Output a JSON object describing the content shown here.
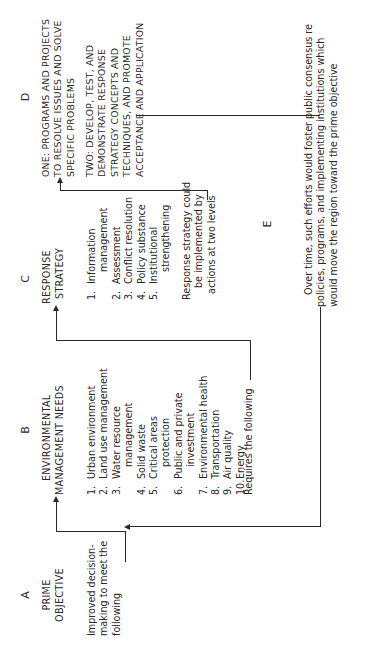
{
  "diagram": {
    "orientation": "rotated 90 degrees counter-clockwise",
    "columns": {
      "A": {
        "letter": "A",
        "heading": [
          "PRIME",
          "OBJECTIVE"
        ],
        "text": [
          "Improved decision-",
          "making to meet the",
          "following"
        ]
      },
      "B": {
        "letter": "B",
        "heading": [
          "ENVIRONMENTAL",
          "MANAGEMENT NEEDS"
        ],
        "items": [
          {
            "num": "1.",
            "label": "Urban environment"
          },
          {
            "num": "2.",
            "label": "Land use management"
          },
          {
            "num": "3.",
            "label": "Water resource",
            "cont": "management"
          },
          {
            "num": "4.",
            "label": "Solid waste"
          },
          {
            "num": "5.",
            "label": "Critical areas",
            "cont": "protection"
          },
          {
            "num": "6.",
            "label": "Public and private",
            "cont": "investment"
          },
          {
            "num": "7.",
            "label": "Environmental health"
          },
          {
            "num": "8.",
            "label": "Transportation"
          },
          {
            "num": "9.",
            "label": "Air quality"
          },
          {
            "num": "10.",
            "label": "Energy"
          }
        ],
        "footer": "Requires the following"
      },
      "C": {
        "letter": "C",
        "heading": [
          "RESPONSE",
          "STRATEGY"
        ],
        "items": [
          {
            "num": "1.",
            "label": "Information",
            "cont": "management"
          },
          {
            "num": "2.",
            "label": "Assessment"
          },
          {
            "num": "3.",
            "label": "Conflict resolution"
          },
          {
            "num": "4.",
            "label": "Policy substance"
          },
          {
            "num": "5.",
            "label": "Institutional",
            "cont": "strengthening"
          }
        ],
        "footer": [
          "Response strategy could",
          "be implemented by",
          "actions at two levels"
        ]
      },
      "D": {
        "letter": "D",
        "one": [
          "ONE: PROGRAMS AND PROJECTS",
          "TO RESOLVE ISSUES AND SOLVE",
          "SPECIFIC PROBLEMS"
        ],
        "two": [
          "TWO: DEVELOP, TEST, AND",
          "DEMONSTRATE RESPONSE",
          "STRATEGY CONCEPTS AND",
          "TECHNIQUES, AND PROMOTE",
          "ACCEPTANCE AND APPLICATION"
        ]
      },
      "E": {
        "letter": "E",
        "text": [
          "Over time, such efforts would foster public consensus re",
          "policies, programs, and implementing institutions which",
          "would move the region toward the prime objective"
        ]
      }
    },
    "colors": {
      "ink": "#2a2a2a",
      "paper": "#ffffff"
    }
  }
}
